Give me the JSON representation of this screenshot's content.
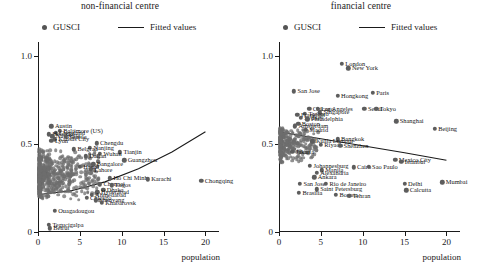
{
  "figure": {
    "width": 481,
    "height": 275,
    "marker_color": "#6e6e6e",
    "line_color": "#1a1a1a",
    "xlabel": "population",
    "axis": {
      "xticks": [
        "0",
        "5",
        "10",
        "15",
        "20"
      ],
      "xtickvals": [
        0,
        5,
        10,
        15,
        20
      ],
      "yticks": [
        "0",
        "0.5",
        "1.0"
      ],
      "ytickvals": [
        0,
        0.5,
        1.0
      ],
      "xlim": [
        0,
        21.5
      ],
      "ylim": [
        0,
        1.08
      ]
    },
    "legend": {
      "marker_label": "GUSCI",
      "line_label": "Fitted values"
    }
  },
  "chart_data": [
    {
      "type": "scatter",
      "panel": "left",
      "title": "non-financial centre",
      "xlabel": "population",
      "ylabel": "",
      "xlim": [
        0,
        21.5
      ],
      "ylim": [
        0,
        1.08
      ],
      "grid": false,
      "legend": [
        "GUSCI",
        "Fitted values"
      ],
      "legend_position": "top",
      "series": [
        {
          "name": "GUSCI",
          "labelled_points": [
            {
              "label": "Austin",
              "x": 1.6,
              "y": 0.6
            },
            {
              "label": "Baltimore (US)",
              "x": 2.6,
              "y": 0.575
            },
            {
              "label": "Cleveland",
              "x": 2.1,
              "y": 0.565
            },
            {
              "label": "Helsinki",
              "x": 1.3,
              "y": 0.555
            },
            {
              "label": "Nashville",
              "x": 1.7,
              "y": 0.545
            },
            {
              "label": "Seattle",
              "x": 3.3,
              "y": 0.54
            },
            {
              "label": "Kansas City",
              "x": 2.0,
              "y": 0.528
            },
            {
              "label": "Lyon",
              "x": 1.6,
              "y": 0.518
            },
            {
              "label": "Chengdu",
              "x": 7.0,
              "y": 0.505
            },
            {
              "label": "Nanjing",
              "x": 6.2,
              "y": 0.48
            },
            {
              "label": "Belgrad",
              "x": 4.3,
              "y": 0.47
            },
            {
              "label": "Tianjin",
              "x": 9.8,
              "y": 0.452
            },
            {
              "label": "Wuhan",
              "x": 7.4,
              "y": 0.445
            },
            {
              "label": "Dalian",
              "x": 5.7,
              "y": 0.43
            },
            {
              "label": "Guangzhou",
              "x": 10.3,
              "y": 0.408
            },
            {
              "label": "Bangalore",
              "x": 6.6,
              "y": 0.385
            },
            {
              "label": "Hanoi",
              "x": 5.0,
              "y": 0.37
            },
            {
              "label": "Lahore",
              "x": 6.3,
              "y": 0.355
            },
            {
              "label": "Ho Chi Minh",
              "x": 8.6,
              "y": 0.305
            },
            {
              "label": "Karachi",
              "x": 13.1,
              "y": 0.3
            },
            {
              "label": "Chennai",
              "x": 7.4,
              "y": 0.272
            },
            {
              "label": "Lagos",
              "x": 8.8,
              "y": 0.265
            },
            {
              "label": "Dhaka",
              "x": 7.8,
              "y": 0.24
            },
            {
              "label": "Hyderabad",
              "x": 7.1,
              "y": 0.225
            },
            {
              "label": "Ahmedabad",
              "x": 6.4,
              "y": 0.21
            },
            {
              "label": "Chicago",
              "x": 5.8,
              "y": 0.195
            },
            {
              "label": "Shenyang",
              "x": 6.9,
              "y": 0.18
            },
            {
              "label": "Khabarovsk",
              "x": 7.6,
              "y": 0.165
            },
            {
              "label": "Ouagadougou",
              "x": 2.0,
              "y": 0.12
            },
            {
              "label": "Tegucigalpa",
              "x": 1.3,
              "y": 0.04
            },
            {
              "label": "Beirut",
              "x": 1.4,
              "y": 0.022
            },
            {
              "label": "Chongqing",
              "x": 19.5,
              "y": 0.292
            }
          ]
        }
      ],
      "fit": {
        "name": "Fitted values",
        "shape": "upward-curving",
        "points": [
          [
            0.4,
            0.215
          ],
          [
            4.0,
            0.235
          ],
          [
            8.0,
            0.285
          ],
          [
            12.0,
            0.36
          ],
          [
            16.0,
            0.455
          ],
          [
            20.0,
            0.57
          ]
        ]
      }
    },
    {
      "type": "scatter",
      "panel": "right",
      "title": "financial centre",
      "xlabel": "population",
      "ylabel": "",
      "xlim": [
        0,
        21.5
      ],
      "ylim": [
        0,
        1.08
      ],
      "grid": false,
      "legend": [
        "GUSCI",
        "Fitted values"
      ],
      "legend_position": "top",
      "series": [
        {
          "name": "GUSCI",
          "labelled_points": [
            {
              "label": "London",
              "x": 7.5,
              "y": 0.955
            },
            {
              "label": "New York",
              "x": 8.3,
              "y": 0.93
            },
            {
              "label": "San Jose",
              "x": 1.8,
              "y": 0.8
            },
            {
              "label": "Hongkong",
              "x": 7.0,
              "y": 0.775
            },
            {
              "label": "Paris",
              "x": 11.2,
              "y": 0.79
            },
            {
              "label": "Chicago",
              "x": 3.6,
              "y": 0.7
            },
            {
              "label": "Los Angeles",
              "x": 4.6,
              "y": 0.7
            },
            {
              "label": "Seoul",
              "x": 10.2,
              "y": 0.7
            },
            {
              "label": "Tokyo",
              "x": 11.6,
              "y": 0.7
            },
            {
              "label": "Singapore",
              "x": 4.9,
              "y": 0.68
            },
            {
              "label": "Toronto",
              "x": 3.1,
              "y": 0.672
            },
            {
              "label": "Frankfurt",
              "x": 2.2,
              "y": 0.665
            },
            {
              "label": "Sydney",
              "x": 2.6,
              "y": 0.648
            },
            {
              "label": "Philadelphia",
              "x": 3.4,
              "y": 0.64
            },
            {
              "label": "Shanghai",
              "x": 14.0,
              "y": 0.63
            },
            {
              "label": "Boston",
              "x": 2.3,
              "y": 0.615
            },
            {
              "label": "Amsterdam",
              "x": 1.9,
              "y": 0.6
            },
            {
              "label": "Beijing",
              "x": 18.6,
              "y": 0.585
            },
            {
              "label": "Madrid",
              "x": 3.2,
              "y": 0.58
            },
            {
              "label": "Bangkok",
              "x": 7.0,
              "y": 0.528
            },
            {
              "label": "Kuala Lumpur",
              "x": 4.0,
              "y": 0.515
            },
            {
              "label": "Riyadh",
              "x": 5.0,
              "y": 0.495
            },
            {
              "label": "Shenzhen",
              "x": 7.3,
              "y": 0.49
            },
            {
              "label": "Jakarta",
              "x": 1.6,
              "y": 0.455
            },
            {
              "label": "Mexico City",
              "x": 13.9,
              "y": 0.412
            },
            {
              "label": "Istanbul",
              "x": 14.6,
              "y": 0.4
            },
            {
              "label": "Johannesburg",
              "x": 3.7,
              "y": 0.375
            },
            {
              "label": "Cairo",
              "x": 8.9,
              "y": 0.368
            },
            {
              "label": "Sao Paulo",
              "x": 10.7,
              "y": 0.372
            },
            {
              "label": "Manila",
              "x": 5.1,
              "y": 0.35
            },
            {
              "label": "Alexandria",
              "x": 4.5,
              "y": 0.335
            },
            {
              "label": "Ankara",
              "x": 4.2,
              "y": 0.31
            },
            {
              "label": "San Jose",
              "x": 2.5,
              "y": 0.275
            },
            {
              "label": "Rio de Janeiro",
              "x": 5.6,
              "y": 0.275
            },
            {
              "label": "Delhi",
              "x": 15.0,
              "y": 0.275
            },
            {
              "label": "Mumbai",
              "x": 19.5,
              "y": 0.282
            },
            {
              "label": "Saint Petersburg",
              "x": 4.5,
              "y": 0.242
            },
            {
              "label": "Calcutta",
              "x": 15.2,
              "y": 0.238
            },
            {
              "label": "Brasilia",
              "x": 2.4,
              "y": 0.222
            },
            {
              "label": "Bogota",
              "x": 6.8,
              "y": 0.21
            },
            {
              "label": "Tehran",
              "x": 8.4,
              "y": 0.205
            }
          ]
        }
      ],
      "fit": {
        "name": "Fitted values",
        "shape": "downward-sloping",
        "points": [
          [
            0.4,
            0.565
          ],
          [
            5.0,
            0.53
          ],
          [
            10.0,
            0.49
          ],
          [
            15.0,
            0.45
          ],
          [
            20.0,
            0.408
          ]
        ]
      }
    }
  ]
}
